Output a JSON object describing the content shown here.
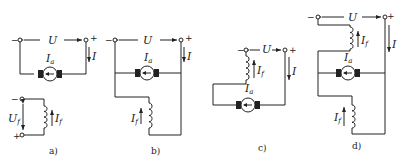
{
  "figure": {
    "panels": [
      {
        "id": "a",
        "label": "a)",
        "type": "separately-excited",
        "supply_voltage": "U",
        "minus": "−",
        "plus": "+",
        "line_current": "I",
        "armature_current": "I",
        "armature_sub": "a",
        "field_voltage": "U",
        "field_voltage_sub": "f",
        "field_current": "I",
        "field_sub": "f",
        "field_minus": "−",
        "field_plus": "+"
      },
      {
        "id": "b",
        "label": "b)",
        "type": "shunt-excited",
        "supply_voltage": "U",
        "minus": "−",
        "plus": "+",
        "line_current": "I",
        "armature_current": "I",
        "armature_sub": "a",
        "field_current": "I",
        "field_sub": "f"
      },
      {
        "id": "c",
        "label": "c)",
        "type": "series-excited",
        "supply_voltage": "U",
        "minus": "−",
        "plus": "+",
        "line_current": "I",
        "armature_current": "I",
        "armature_sub": "a",
        "field_current": "I",
        "field_sub": "f"
      },
      {
        "id": "d",
        "label": "d)",
        "type": "compound-excited",
        "supply_voltage": "U",
        "minus": "−",
        "plus": "+",
        "line_current": "I",
        "armature_current": "I",
        "armature_sub": "a",
        "series_field_current": "I",
        "series_field_sub": "f",
        "shunt_field_current": "I",
        "shunt_field_sub": "f"
      }
    ]
  },
  "colors": {
    "line": "#222222",
    "background": "#ffffff"
  }
}
